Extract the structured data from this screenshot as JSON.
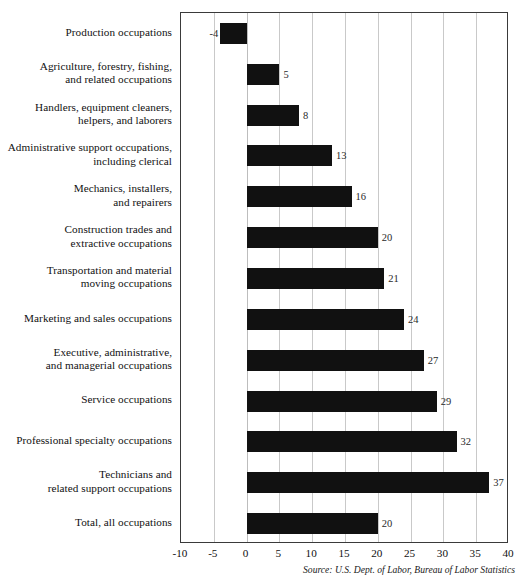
{
  "chart_data": {
    "type": "bar",
    "orientation": "horizontal",
    "title": "",
    "subtitle": "",
    "xlabel": "",
    "ylabel": "",
    "xlim": [
      -10,
      40
    ],
    "xticks": [
      -10,
      -5,
      0,
      5,
      10,
      15,
      20,
      25,
      30,
      35,
      40
    ],
    "xtick_labels": [
      "-10",
      "-5",
      "0",
      "5",
      "10",
      "15",
      "20",
      "25",
      "30",
      "35",
      "40"
    ],
    "grid": "vertical",
    "legend": "none",
    "bar_color": "#111111",
    "categories": [
      "Production occupations",
      "Agriculture, forestry, fishing, and related occupations",
      "Handlers, equipment cleaners, helpers, and laborers",
      "Administrative support occupations, including clerical",
      "Mechanics, installers, and repairers",
      "Construction trades and extractive occupations",
      "Transportation and material moving occupations",
      "Marketing and sales occupations",
      "Executive, administrative, and managerial occupations",
      "Service occupations",
      "Professional specialty occupations",
      "Technicians and related support occupations",
      "Total, all occupations"
    ],
    "values": [
      -4,
      5,
      8,
      13,
      16,
      20,
      21,
      24,
      27,
      29,
      32,
      37,
      20
    ],
    "annotation": "Source: U.S. Dept. of Labor, Bureau of Labor Statistics"
  },
  "labels": {
    "rows": [
      {
        "lines": [
          "Production occupations"
        ],
        "value": -4,
        "value_text": "-4"
      },
      {
        "lines": [
          "Agriculture, forestry, fishing,",
          "and related occupations"
        ],
        "value": 5,
        "value_text": "5"
      },
      {
        "lines": [
          "Handlers, equipment cleaners,",
          "helpers, and laborers"
        ],
        "value": 8,
        "value_text": "8"
      },
      {
        "lines": [
          "Administrative support occupations,",
          "including clerical"
        ],
        "value": 13,
        "value_text": "13"
      },
      {
        "lines": [
          "Mechanics, installers,",
          "and repairers"
        ],
        "value": 16,
        "value_text": "16"
      },
      {
        "lines": [
          "Construction trades and",
          "extractive occupations"
        ],
        "value": 20,
        "value_text": "20"
      },
      {
        "lines": [
          "Transportation and material",
          "moving occupations"
        ],
        "value": 21,
        "value_text": "21"
      },
      {
        "lines": [
          "Marketing and sales occupations"
        ],
        "value": 24,
        "value_text": "24"
      },
      {
        "lines": [
          "Executive, administrative,",
          "and managerial occupations"
        ],
        "value": 27,
        "value_text": "27"
      },
      {
        "lines": [
          "Service occupations"
        ],
        "value": 29,
        "value_text": "29"
      },
      {
        "lines": [
          "Professional specialty occupations"
        ],
        "value": 32,
        "value_text": "32"
      },
      {
        "lines": [
          "Technicians and",
          "related support occupations"
        ],
        "value": 37,
        "value_text": "37"
      },
      {
        "lines": [
          "Total, all occupations"
        ],
        "value": 20,
        "value_text": "20"
      }
    ]
  },
  "source": {
    "text": "Source: U.S. Dept. of Labor, Bureau of Labor Statistics"
  }
}
